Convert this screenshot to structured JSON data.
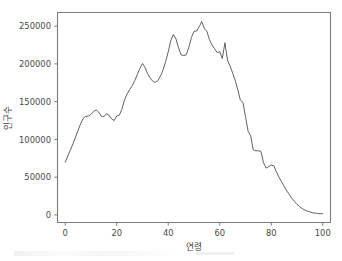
{
  "figure": {
    "background_color": "#ffffff",
    "line_color": "#60606a",
    "axis_color": "#7d7d80"
  },
  "chart_data": {
    "type": "line",
    "title": "",
    "xlabel": "연령",
    "ylabel": "인구수",
    "xlim": [
      -3,
      103
    ],
    "ylim": [
      -10000,
      268000
    ],
    "xticks": [
      0,
      20,
      40,
      60,
      80,
      100
    ],
    "xtick_labels": [
      "0",
      "20",
      "40",
      "60",
      "80",
      "100"
    ],
    "yticks": [
      0,
      50000,
      100000,
      150000,
      200000,
      250000
    ],
    "ytick_labels": [
      "0",
      "50000",
      "100000",
      "150000",
      "200000",
      "250000"
    ],
    "grid": false,
    "legend": null,
    "series": [
      {
        "name": "인구수",
        "x": [
          0,
          1,
          2,
          3,
          4,
          5,
          6,
          7,
          8,
          9,
          10,
          11,
          12,
          13,
          14,
          15,
          16,
          17,
          18,
          19,
          20,
          21,
          22,
          23,
          24,
          25,
          26,
          27,
          28,
          29,
          30,
          31,
          32,
          33,
          34,
          35,
          36,
          37,
          38,
          39,
          40,
          41,
          42,
          43,
          44,
          45,
          46,
          47,
          48,
          49,
          50,
          51,
          52,
          53,
          54,
          55,
          56,
          57,
          58,
          59,
          60,
          61,
          62,
          63,
          64,
          65,
          66,
          67,
          68,
          69,
          70,
          71,
          72,
          73,
          74,
          75,
          76,
          77,
          78,
          79,
          80,
          81,
          82,
          83,
          84,
          85,
          86,
          87,
          88,
          89,
          90,
          91,
          92,
          93,
          94,
          95,
          96,
          97,
          98,
          99,
          100
        ],
        "values": [
          70000,
          78000,
          86000,
          94000,
          103000,
          112000,
          121000,
          128000,
          130500,
          131000,
          133000,
          137000,
          139000,
          136000,
          131000,
          130000,
          134000,
          132000,
          127000,
          125000,
          131000,
          132000,
          140000,
          152000,
          160000,
          166000,
          171000,
          178000,
          186000,
          194000,
          200500,
          195000,
          187000,
          181000,
          177000,
          175500,
          178000,
          184000,
          192000,
          203000,
          216000,
          231000,
          239000,
          233000,
          221000,
          212000,
          211000,
          212000,
          222000,
          235000,
          243000,
          243500,
          249000,
          256000,
          247000,
          243000,
          232000,
          225000,
          220000,
          215000,
          216000,
          207000,
          228000,
          205000,
          197000,
          188000,
          178000,
          166000,
          152000,
          149000,
          130000,
          111000,
          105000,
          86000,
          85000,
          85000,
          84000,
          69000,
          62000,
          64000,
          66000,
          65000,
          57000,
          50000,
          44000,
          38000,
          32000,
          27000,
          22000,
          18000,
          14000,
          11000,
          8500,
          6500,
          5000,
          4000,
          3000,
          2400,
          2000,
          1700,
          1500
        ]
      }
    ]
  },
  "axis_titles": {
    "x": "연령",
    "y": "인구수"
  }
}
